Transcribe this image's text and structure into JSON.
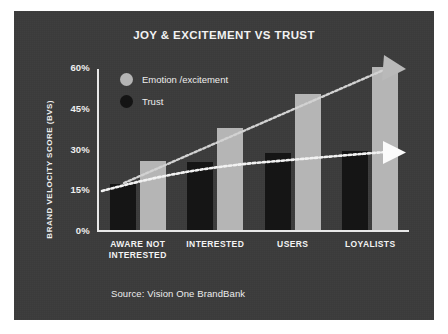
{
  "card": {
    "background": "#3b3b3b"
  },
  "chart_data": {
    "type": "bar",
    "title": "JOY & EXCITEMENT VS TRUST",
    "xlabel": "",
    "ylabel": "BRAND VELOCITY SCORE (BVS)",
    "categories": [
      "AWARE NOT INTERESTED",
      "INTERESTED",
      "USERS",
      "LOYALISTS"
    ],
    "category_lines": [
      [
        "AWARE NOT",
        "INTERESTED"
      ],
      [
        "INTERESTED"
      ],
      [
        "USERS"
      ],
      [
        "LOYALISTS"
      ]
    ],
    "series": [
      {
        "name": "Trust",
        "color": "#151515",
        "values": [
          17,
          25,
          28.5,
          29
        ]
      },
      {
        "name": "Emotion /excitement",
        "color": "#b5b5b5",
        "values": [
          25.5,
          37.5,
          50,
          60
        ]
      }
    ],
    "ylim": [
      0,
      60
    ],
    "yticks": [
      0,
      15,
      30,
      45,
      60
    ],
    "ytick_labels": [
      "0%",
      "15%",
      "30%",
      "45%",
      "60%"
    ],
    "grid": false,
    "legend": {
      "position": "top-left-inside",
      "entries": [
        {
          "label": "Emotion /excitement",
          "color": "#b5b5b5",
          "marker": "circle"
        },
        {
          "label": "Trust",
          "color": "#141414",
          "marker": "circle"
        }
      ]
    },
    "annotations": [
      {
        "name": "emotion-trend-arrow",
        "style": "dotted-line-with-arrowhead",
        "color": "#d6d6d6",
        "from": [
          124,
          182
        ],
        "to": [
          389,
          64
        ],
        "description": "steeply rising dotted trend arrow for emotion/excitement"
      },
      {
        "name": "trust-trend-arrow",
        "style": "dotted-line-with-arrowhead",
        "color": "#f0f0f0",
        "from": [
          100,
          190
        ],
        "to": [
          392,
          148
        ],
        "description": "nearly flat dotted trend arrow for trust"
      }
    ]
  },
  "footer": {
    "source": "Source: Vision One BrandBank"
  }
}
